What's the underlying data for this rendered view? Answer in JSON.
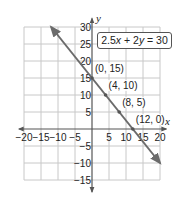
{
  "chart_data": {
    "type": "line",
    "title": "",
    "equation": "2.5x + 2y = 30",
    "xlabel": "x",
    "ylabel": "y",
    "xlim": [
      -20,
      20
    ],
    "ylim": [
      -15,
      30
    ],
    "grid": true,
    "grid_step": 5,
    "x_ticks": [
      -20,
      -15,
      -10,
      -5,
      5,
      10,
      15,
      20
    ],
    "y_ticks": [
      30,
      25,
      20,
      15,
      10,
      5,
      -5,
      -10,
      -15
    ],
    "x_tick_labels": [
      "−20",
      "−15",
      "−10",
      "−5",
      "5",
      "10",
      "15",
      "20"
    ],
    "y_tick_labels": [
      "30",
      "25",
      "20",
      "15",
      "10",
      "5",
      "−5",
      "−10",
      "−15"
    ],
    "line": {
      "slope": -1.25,
      "intercept": 15,
      "x_start": -12,
      "x_end": 20,
      "arrows": "both"
    },
    "points": [
      {
        "x": 0,
        "y": 15,
        "label": "(0, 15)"
      },
      {
        "x": 4,
        "y": 10,
        "label": "(4, 10)"
      },
      {
        "x": 8,
        "y": 5,
        "label": "(8, 5)"
      },
      {
        "x": 12,
        "y": 0,
        "label": "(12, 0)"
      }
    ],
    "legend": "none",
    "colors": {
      "line": "#6b6b6b",
      "grid": "#c8c8c8",
      "axis": "#555555"
    }
  },
  "equation_label": "2.5x + 2y = 30"
}
